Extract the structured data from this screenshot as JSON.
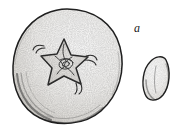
{
  "figure": {
    "kind": "botanical-line-drawing",
    "background_color": "#ffffff",
    "ink_color": "#1a1a1a",
    "labels": [
      {
        "text": "a",
        "refers_to": "seed",
        "x": 138,
        "y": 28,
        "style": "italic"
      }
    ],
    "parts": {
      "fruit": {
        "name": "fruit-apex-view",
        "description": "round berry seen from the stem end, stippled shading, darker along lower-left rim",
        "center_x": 67,
        "center_y": 66,
        "radius_x": 55,
        "radius_y": 57,
        "fill_color": "#fbfbfa",
        "outline_color": "#1f1f1f"
      },
      "calyx": {
        "name": "star-calyx",
        "description": "five-lobed star-shaped calyx at the centre with fine tendrils extending left and right",
        "center_x": 64,
        "center_y": 62,
        "points": 5,
        "outer_radius": 24,
        "inner_radius": 10,
        "fill_color": "#f2f1ef",
        "outline_color": "#262626"
      },
      "seed": {
        "name": "seed",
        "description": "single elongated ovate seed, pointed at the upper right, rounded below, faint median line",
        "center_x": 158,
        "center_y": 79,
        "width": 24,
        "height": 44,
        "rotation_deg": 8,
        "fill_color": "#fbfbfa",
        "outline_color": "#1f1f1f"
      }
    }
  }
}
